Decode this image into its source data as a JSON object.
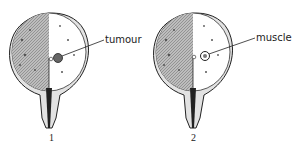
{
  "figure": {
    "panels": [
      {
        "number": "1",
        "label": "tumour"
      },
      {
        "number": "2",
        "label": "muscle"
      }
    ],
    "colors": {
      "line": "#222222",
      "shade": "#9a9a9a",
      "wall": "#d8d8d8",
      "background": "#ffffff"
    }
  }
}
